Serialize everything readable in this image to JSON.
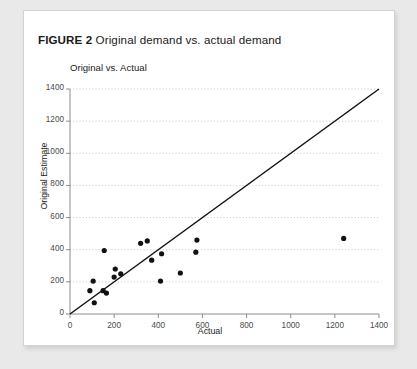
{
  "caption": {
    "figure_label": "FIGURE 2",
    "figure_text": "Original demand vs. actual demand"
  },
  "chart_data": {
    "type": "scatter",
    "title": "Original vs. Actual",
    "xlabel": "Actual",
    "ylabel": "Original Estimate",
    "xlim": [
      0,
      1400
    ],
    "ylim": [
      0,
      1400
    ],
    "xticks": [
      0,
      200,
      400,
      600,
      800,
      1000,
      1200,
      1400
    ],
    "yticks": [
      0,
      200,
      400,
      600,
      800,
      1000,
      1200,
      1400
    ],
    "grid": "horizontal-dotted",
    "legend": "none",
    "marker_color": "#111111",
    "line_color": "#111111",
    "points": [
      {
        "x": 90,
        "y": 145
      },
      {
        "x": 105,
        "y": 205
      },
      {
        "x": 110,
        "y": 70
      },
      {
        "x": 150,
        "y": 145
      },
      {
        "x": 155,
        "y": 395
      },
      {
        "x": 165,
        "y": 130
      },
      {
        "x": 200,
        "y": 230
      },
      {
        "x": 205,
        "y": 280
      },
      {
        "x": 230,
        "y": 250
      },
      {
        "x": 320,
        "y": 440
      },
      {
        "x": 350,
        "y": 455
      },
      {
        "x": 370,
        "y": 335
      },
      {
        "x": 410,
        "y": 205
      },
      {
        "x": 415,
        "y": 375
      },
      {
        "x": 500,
        "y": 255
      },
      {
        "x": 570,
        "y": 385
      },
      {
        "x": 575,
        "y": 460
      },
      {
        "x": 1240,
        "y": 470
      }
    ],
    "reference_line": {
      "label": "y = x",
      "from": [
        0,
        0
      ],
      "to": [
        1400,
        1400
      ]
    }
  }
}
